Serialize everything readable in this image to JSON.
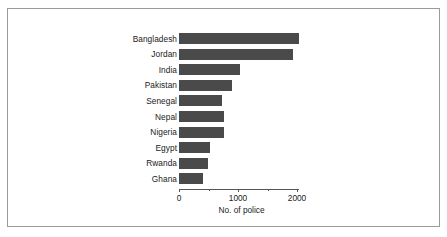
{
  "figure": {
    "border_color": "#9a9a9a",
    "background": "#ffffff"
  },
  "chart_data": {
    "type": "bar",
    "orientation": "horizontal",
    "title": "",
    "xlabel": "No. of police",
    "ylabel": "",
    "xlim": [
      0,
      2200
    ],
    "xticks": [
      0,
      1000,
      2000
    ],
    "xtick_labels": [
      "0",
      "1000",
      "2000"
    ],
    "minor_xticks": [
      500,
      1500
    ],
    "grid": false,
    "legend": null,
    "bar_color": "#4a4a4a",
    "categories": [
      "Bangladesh",
      "Jordan",
      "India",
      "Pakistan",
      "Senegal",
      "Nepal",
      "Nigeria",
      "Egypt",
      "Rwanda",
      "Ghana"
    ],
    "values": [
      2030,
      1930,
      1040,
      900,
      730,
      760,
      770,
      520,
      490,
      400
    ]
  }
}
